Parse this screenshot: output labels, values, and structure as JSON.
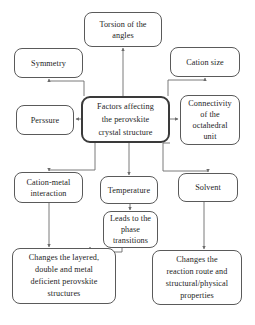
{
  "diagram": {
    "title": "Factors affecting the perovskite crystal structure",
    "type": "flowchart",
    "canvas": {
      "width": 255,
      "height": 325
    },
    "style": {
      "background": "#ffffff",
      "box_border": "#5a5a5a",
      "hub_border": "#3a3a3a",
      "text_color": "#1d1d1d",
      "connector_color": "#6b6b6b"
    },
    "nodes": {
      "torsion": {
        "label": "Torsion of the\nangles",
        "x": 84,
        "y": 12,
        "w": 78,
        "h": 35,
        "font": 8.2,
        "lh": 11
      },
      "symmetry": {
        "label": "Symmetry",
        "x": 14,
        "y": 48,
        "w": 69,
        "h": 30,
        "font": 8.2,
        "lh": 11
      },
      "cation_size": {
        "label": "Cation size",
        "x": 170,
        "y": 47,
        "w": 70,
        "h": 30,
        "font": 8.2,
        "lh": 11
      },
      "hub": {
        "label": "Factors affecting\nthe perovskite\ncrystal structure",
        "x": 81,
        "y": 96,
        "w": 89,
        "h": 47,
        "font": 8.2,
        "lh": 13
      },
      "pressure": {
        "label": "Perssure",
        "x": 16,
        "y": 105,
        "w": 58,
        "h": 30,
        "font": 8.2,
        "lh": 11
      },
      "connectivity": {
        "label": "Connectivity\nof the\noctahedral\nunit",
        "x": 180,
        "y": 95,
        "w": 60,
        "h": 50,
        "font": 8.2,
        "lh": 11
      },
      "cation_metal": {
        "label": "Cation-metal\ninteraction",
        "x": 14,
        "y": 172,
        "w": 69,
        "h": 31,
        "font": 8.2,
        "lh": 11
      },
      "temperature": {
        "label": "Temperature",
        "x": 100,
        "y": 176,
        "w": 58,
        "h": 28,
        "font": 8.2,
        "lh": 11
      },
      "solvent": {
        "label": "Solvent",
        "x": 178,
        "y": 173,
        "w": 60,
        "h": 29,
        "font": 8.2,
        "lh": 11
      },
      "phase": {
        "label": "Leads to the\nphase\ntransitions",
        "x": 103,
        "y": 211,
        "w": 55,
        "h": 37,
        "font": 8.2,
        "lh": 11
      },
      "changes_layered": {
        "label": "Changes the layered,\ndouble and metal\ndeficient perovskite\nstructures",
        "x": 12,
        "y": 248,
        "w": 104,
        "h": 56,
        "font": 8.2,
        "lh": 12
      },
      "changes_reaction": {
        "label": "Changes the\nreaction route and\nstructural/physical\nproperties",
        "x": 152,
        "y": 250,
        "w": 90,
        "h": 55,
        "font": 8.2,
        "lh": 12
      }
    },
    "edges": [
      {
        "name": "hub-to-torsion",
        "from": "hub",
        "to": "torsion"
      },
      {
        "name": "hub-to-symmetry",
        "from": "hub",
        "to": "symmetry"
      },
      {
        "name": "hub-to-cation-size",
        "from": "hub",
        "to": "cation_size"
      },
      {
        "name": "hub-to-pressure",
        "from": "hub",
        "to": "pressure"
      },
      {
        "name": "hub-to-connectivity",
        "from": "hub",
        "to": "connectivity"
      },
      {
        "name": "hub-to-cation-metal",
        "from": "hub",
        "to": "cation_metal"
      },
      {
        "name": "hub-to-temperature",
        "from": "hub",
        "to": "temperature"
      },
      {
        "name": "hub-to-solvent",
        "from": "hub",
        "to": "solvent"
      },
      {
        "name": "temperature-to-phase",
        "from": "temperature",
        "to": "phase"
      },
      {
        "name": "cation-metal-to-changes-layered",
        "from": "cation_metal",
        "to": "changes_layered"
      },
      {
        "name": "phase-to-changes-layered",
        "from": "phase",
        "to": "changes_layered"
      },
      {
        "name": "solvent-to-changes-reaction",
        "from": "solvent",
        "to": "changes_reaction"
      }
    ]
  }
}
